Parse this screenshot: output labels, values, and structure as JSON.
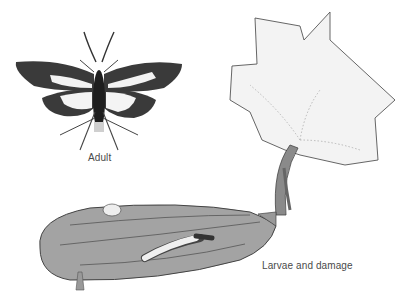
{
  "figure": {
    "subjects": [
      {
        "id": "adult",
        "label": "Adult",
        "depiction": "moth-with-white-wing-patches"
      },
      {
        "id": "larvae",
        "label": "Larvae and damage",
        "depiction": "cucumber-fruit-with-larvae-and-vine-leaf"
      }
    ],
    "colors": {
      "background": "#ffffff",
      "ink": "#2b2b2b",
      "wing_dark": "#3a3a3a",
      "fruit_gray": "#9a9a9a",
      "leaf_gray": "#e6e6e6",
      "label_text": "#4a4a4a"
    }
  }
}
